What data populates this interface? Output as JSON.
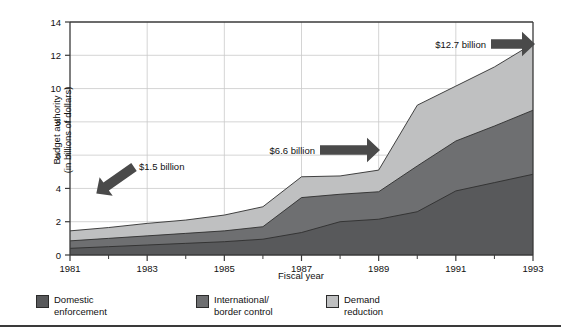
{
  "chart_data": {
    "type": "area",
    "stacked": true,
    "title": "",
    "xlabel": "Fiscal year",
    "ylabel": "Budget authority\n(in billions of dollars)",
    "ylabel_line1": "Budget authority",
    "ylabel_line2": "(in billions of dollars)",
    "x": [
      1981,
      1982,
      1983,
      1984,
      1985,
      1986,
      1987,
      1988,
      1989,
      1990,
      1991,
      1992,
      1993
    ],
    "xlim": [
      1981,
      1993
    ],
    "ylim": [
      0,
      14
    ],
    "ytick_labels": [
      "0",
      "2",
      "4",
      "6",
      "8",
      "10",
      "12",
      "14"
    ],
    "ytick_values": [
      0,
      2,
      4,
      6,
      8,
      10,
      12,
      14
    ],
    "xtick_labels": [
      "1981",
      "1983",
      "1985",
      "1987",
      "1989",
      "1991",
      "1993"
    ],
    "xtick_values": [
      1981,
      1983,
      1985,
      1987,
      1989,
      1991,
      1993
    ],
    "xminor_values": [
      1982,
      1984,
      1986,
      1988,
      1990,
      1992
    ],
    "grid": true,
    "legend_position": "below-plot",
    "series": [
      {
        "name": "Domestic enforcement",
        "color": "#58595b",
        "values": [
          0.4,
          0.5,
          0.6,
          0.7,
          0.8,
          0.95,
          1.35,
          2.0,
          2.15,
          2.6,
          3.85,
          4.35,
          4.85
        ]
      },
      {
        "name": "International/border control",
        "color": "#6e6f71",
        "values": [
          0.45,
          0.5,
          0.55,
          0.6,
          0.65,
          0.75,
          2.1,
          1.65,
          1.65,
          2.75,
          3.0,
          3.4,
          3.85
        ]
      },
      {
        "name": "Demand reduction",
        "color": "#bfc0c1",
        "values": [
          0.6,
          0.65,
          0.75,
          0.8,
          0.95,
          1.2,
          1.25,
          1.1,
          1.3,
          3.65,
          3.3,
          3.55,
          4.0
        ]
      }
    ],
    "totals": [
      1.45,
      1.65,
      1.9,
      2.1,
      2.4,
      2.9,
      4.7,
      4.75,
      5.1,
      9.0,
      10.15,
      11.3,
      12.7
    ],
    "annotations": [
      {
        "id": "ann-1981",
        "label": "$1.5 billion",
        "value": 1.5,
        "year": 1981,
        "arrow": "down-left"
      },
      {
        "id": "ann-1987",
        "label": "$6.6 billion",
        "value": 6.6,
        "year": 1988,
        "arrow": "right"
      },
      {
        "id": "ann-1993",
        "label": "$12.7 billion",
        "value": 12.7,
        "year": 1993,
        "arrow": "right"
      }
    ]
  },
  "legend": {
    "items": [
      {
        "label_line1": "Domestic",
        "label_line2": "enforcement",
        "color": "#58595b"
      },
      {
        "label_line1": "International/",
        "label_line2": "border control",
        "color": "#6e6f71"
      },
      {
        "label_line1": "Demand",
        "label_line2": "reduction",
        "color": "#bfc0c1"
      }
    ]
  },
  "axes": {
    "x_title": "Fiscal year",
    "y_title_line1": "Budget authority",
    "y_title_line2": "(in billions of dollars)"
  },
  "colors": {
    "domestic": "#58595b",
    "international": "#6e6f71",
    "demand": "#bfc0c1",
    "axis": "#3a3a3a",
    "grid": "#c9c9c9",
    "arrow": "#4a4a4a"
  }
}
